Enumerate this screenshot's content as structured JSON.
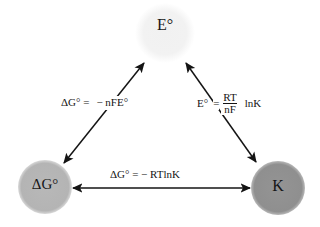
{
  "diagram": {
    "type": "relationship-triangle",
    "background_color": "#ffffff",
    "nodes": [
      {
        "id": "standard-cell-potential",
        "label": "E°",
        "position": "top",
        "shape": "circle",
        "fill_color": "#f3f3f3",
        "center_x": 165,
        "center_y": 33,
        "radius": 30
      },
      {
        "id": "standard-gibbs-energy",
        "label": "ΔG°",
        "position": "bottom-left",
        "shape": "circle",
        "fill_color": "#b6b6b6",
        "center_x": 45,
        "center_y": 187,
        "radius": 27
      },
      {
        "id": "equilibrium-constant",
        "label": "K",
        "position": "bottom-right",
        "shape": "circle",
        "fill_color": "#919191",
        "center_x": 278,
        "center_y": 188,
        "radius": 27
      }
    ],
    "edges": [
      {
        "id": "edge-dg-e",
        "from": "standard-gibbs-energy",
        "to": "standard-cell-potential",
        "arrow": "double",
        "label_parts": {
          "lhs": "ΔG°",
          "equals": "=",
          "rhs": "− nFE°"
        },
        "label_text": "ΔG° = − nFE°"
      },
      {
        "id": "edge-e-k",
        "from": "standard-cell-potential",
        "to": "equilibrium-constant",
        "arrow": "double",
        "label_parts": {
          "lhs": "E°",
          "equals": "=",
          "fraction_numerator": "RT",
          "fraction_denominator": "nF",
          "trailing": "lnK"
        },
        "label_text": "E° = RT/nF lnK"
      },
      {
        "id": "edge-dg-k",
        "from": "standard-gibbs-energy",
        "to": "equilibrium-constant",
        "arrow": "double",
        "label_text": "ΔG° = − RTlnK"
      }
    ],
    "colors": {
      "stroke": "#141414",
      "text": "#141414",
      "node_light": "#f3f3f3",
      "node_mid": "#b6b6b6",
      "node_dark": "#919191"
    }
  }
}
